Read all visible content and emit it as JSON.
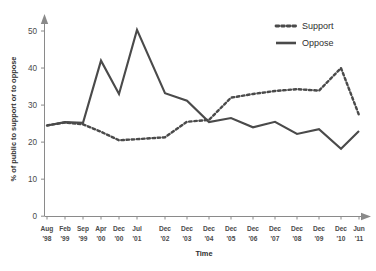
{
  "chart_data": {
    "type": "line",
    "title": "",
    "xlabel": "Time",
    "ylabel": "% of public to support or to oppose",
    "ylim": [
      0,
      52
    ],
    "yticks": [
      0,
      10,
      20,
      30,
      40,
      50
    ],
    "grid": false,
    "legend_position": "top-right",
    "categories": [
      "Aug '98",
      "Feb '99",
      "Sep '99",
      "Apr '00",
      "Dec '00",
      "Jul '01",
      "Dec '02",
      "Dec '03",
      "Dec '04",
      "Dec '05",
      "Dec '06",
      "Dec '07",
      "Dec '08",
      "Dec '09",
      "Dec '10",
      "Jun '11"
    ],
    "x_tick_labels": [
      {
        "month": "Aug",
        "year": "'98"
      },
      {
        "month": "Feb",
        "year": "'99"
      },
      {
        "month": "Sep",
        "year": "'99"
      },
      {
        "month": "Apr",
        "year": "'00"
      },
      {
        "month": "Dec",
        "year": "'00"
      },
      {
        "month": "Jul",
        "year": "'01"
      },
      {
        "month": "Dec",
        "year": "'02"
      },
      {
        "month": "Dec",
        "year": "'03"
      },
      {
        "month": "Dec",
        "year": "'04"
      },
      {
        "month": "Dec",
        "year": "'05"
      },
      {
        "month": "Dec",
        "year": "'06"
      },
      {
        "month": "Dec",
        "year": "'07"
      },
      {
        "month": "Dec",
        "year": "'08"
      },
      {
        "month": "Dec",
        "year": "'09"
      },
      {
        "month": "Dec",
        "year": "'10"
      },
      {
        "month": "Jun",
        "year": "'11"
      }
    ],
    "series": [
      {
        "name": "Support",
        "style": "dotted",
        "color": "#4a4a4a",
        "x_px": [
          47,
          65,
          83,
          101,
          119,
          137,
          165,
          187,
          209,
          231,
          253,
          275,
          297,
          319,
          341,
          359
        ],
        "values": [
          24.5,
          25.3,
          24.8,
          22.8,
          20.5,
          20.8,
          21.3,
          25.5,
          26.0,
          32.0,
          33.0,
          33.8,
          34.3,
          33.9,
          40.0,
          27.3
        ]
      },
      {
        "name": "Oppose",
        "style": "solid",
        "color": "#4a4a4a",
        "x_px": [
          47,
          65,
          83,
          101,
          119,
          137,
          165,
          187,
          209,
          231,
          253,
          275,
          297,
          319,
          341,
          359
        ],
        "values": [
          24.5,
          25.4,
          25.2,
          42.0,
          33.0,
          50.3,
          33.2,
          31.2,
          25.4,
          26.5,
          24.0,
          25.5,
          22.2,
          23.5,
          18.2,
          23.0
        ]
      }
    ]
  },
  "legend": {
    "items": [
      {
        "label": "Support",
        "style": "dotted"
      },
      {
        "label": "Oppose",
        "style": "solid"
      }
    ]
  },
  "axes": {
    "y_title": "% of public to support or to oppose",
    "x_title": "Time"
  }
}
